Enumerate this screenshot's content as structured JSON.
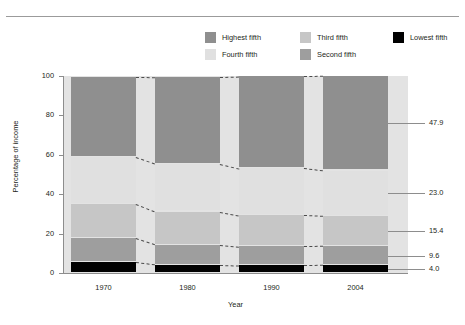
{
  "legend": {
    "columns": [
      [
        {
          "label": "Highest fifth",
          "color": "#8f8f8f",
          "key": "highest"
        },
        {
          "label": "Fourth fifth",
          "color": "#e0e0e0",
          "key": "fourth"
        }
      ],
      [
        {
          "label": "Third fifth",
          "color": "#c6c6c6",
          "key": "third"
        },
        {
          "label": "Second fifth",
          "color": "#9e9e9e",
          "key": "second"
        }
      ],
      [
        {
          "label": "Lowest fifth",
          "color": "#000000",
          "key": "lowest"
        }
      ]
    ]
  },
  "chart_data": {
    "type": "bar",
    "subtype": "stacked-percentage",
    "title": "",
    "xlabel": "Year",
    "ylabel": "Percentage of income",
    "categories": [
      "1970",
      "1980",
      "1990",
      "2004"
    ],
    "ylim": [
      0,
      100
    ],
    "yticks": [
      0,
      20,
      40,
      60,
      80,
      100
    ],
    "ytick_labels": [
      "0",
      "20",
      "40",
      "60",
      "80",
      "100"
    ],
    "grid": false,
    "legend_position": "top",
    "stack_order_bottom_to_top": [
      "lowest",
      "second",
      "third",
      "fourth",
      "highest"
    ],
    "series": [
      {
        "name": "Lowest fifth",
        "key": "lowest",
        "color": "#000000",
        "values": [
          5.4,
          4.2,
          3.9,
          4.0
        ]
      },
      {
        "name": "Second fifth",
        "key": "second",
        "color": "#9e9e9e",
        "values": [
          12.2,
          10.2,
          9.6,
          9.6
        ]
      },
      {
        "name": "Third fifth",
        "key": "third",
        "color": "#c6c6c6",
        "values": [
          17.4,
          16.8,
          15.9,
          15.4
        ]
      },
      {
        "name": "Fourth fifth",
        "key": "fourth",
        "color": "#e0e0e0",
        "values": [
          23.8,
          24.3,
          23.8,
          23.0
        ]
      },
      {
        "name": "Highest fifth",
        "key": "highest",
        "color": "#8f8f8f",
        "values": [
          40.9,
          44.1,
          46.6,
          47.9
        ]
      }
    ],
    "end_labels": [
      {
        "key": "highest",
        "value": "47.9"
      },
      {
        "key": "fourth",
        "value": "23.0"
      },
      {
        "key": "third",
        "value": "15.4"
      },
      {
        "key": "second",
        "value": "9.6"
      },
      {
        "key": "lowest",
        "value": "4.0"
      }
    ],
    "plot_background": "#e3e3e3",
    "connector_style": "dashed"
  }
}
